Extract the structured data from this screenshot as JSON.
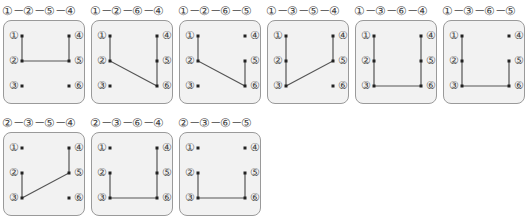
{
  "node_labels": {
    "1": "①",
    "2": "②",
    "3": "③",
    "4": "④",
    "5": "⑤",
    "6": "⑥"
  },
  "diagrams": [
    {
      "title": "①－②－⑤－④",
      "path": [
        1,
        2,
        5,
        4
      ]
    },
    {
      "title": "①－②－⑥－④",
      "path": [
        1,
        2,
        6,
        4
      ]
    },
    {
      "title": "①－②－⑥－⑤",
      "path": [
        1,
        2,
        6,
        5
      ]
    },
    {
      "title": "①－③－⑤－④",
      "path": [
        1,
        3,
        5,
        4
      ]
    },
    {
      "title": "①－③－⑥－④",
      "path": [
        1,
        3,
        6,
        4
      ]
    },
    {
      "title": "①－③－⑥－⑤",
      "path": [
        1,
        3,
        6,
        5
      ]
    },
    {
      "title": "②－③－⑤－④",
      "path": [
        2,
        3,
        5,
        4
      ]
    },
    {
      "title": "②－③－⑥－④",
      "path": [
        2,
        3,
        6,
        4
      ]
    },
    {
      "title": "②－③－⑥－⑤",
      "path": [
        2,
        3,
        6,
        5
      ]
    }
  ],
  "colors": {
    "line": "#555555",
    "panel_bg": "#f2f2f2",
    "panel_border": "#9a9a9a"
  }
}
